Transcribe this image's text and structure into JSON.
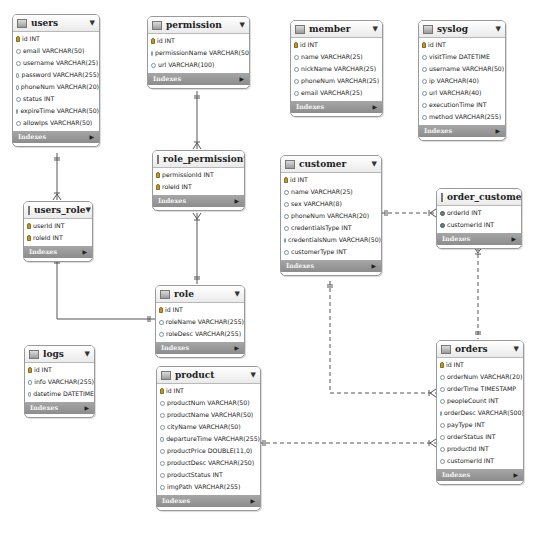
{
  "diagram": {
    "indexes_label": "Indexes",
    "tables": {
      "users": {
        "name": "users",
        "columns": [
          {
            "type": "key",
            "text": "id INT"
          },
          {
            "type": "attr",
            "text": "email VARCHAR(50)"
          },
          {
            "type": "attr",
            "text": "username VARCHAR(25)"
          },
          {
            "type": "attr",
            "text": "password VARCHAR(255)"
          },
          {
            "type": "attr",
            "text": "phoneNum VARCHAR(20)"
          },
          {
            "type": "attr",
            "text": "status INT"
          },
          {
            "type": "attr",
            "text": "expireTime VARCHAR(50)"
          },
          {
            "type": "attr",
            "text": "allowIps VARCHAR(50)"
          }
        ]
      },
      "permission": {
        "name": "permission",
        "columns": [
          {
            "type": "key",
            "text": "id INT"
          },
          {
            "type": "attr",
            "text": "permissionName VARCHAR(50)"
          },
          {
            "type": "attr",
            "text": "url VARCHAR(100)"
          }
        ]
      },
      "member": {
        "name": "member",
        "columns": [
          {
            "type": "key",
            "text": "id INT"
          },
          {
            "type": "attr",
            "text": "name VARCHAR(25)"
          },
          {
            "type": "attr",
            "text": "nickName VARCHAR(25)"
          },
          {
            "type": "attr",
            "text": "phoneNum VARCHAR(25)"
          },
          {
            "type": "attr",
            "text": "email VARCHAR(25)"
          }
        ]
      },
      "syslog": {
        "name": "syslog",
        "columns": [
          {
            "type": "key",
            "text": "id INT"
          },
          {
            "type": "attr",
            "text": "visitTime DATETIME"
          },
          {
            "type": "attr",
            "text": "username VARCHAR(50)"
          },
          {
            "type": "attr",
            "text": "ip VARCHAR(40)"
          },
          {
            "type": "attr",
            "text": "url VARCHAR(40)"
          },
          {
            "type": "attr",
            "text": "executionTime INT"
          },
          {
            "type": "attr",
            "text": "method VARCHAR(255)"
          }
        ]
      },
      "role_permission": {
        "name": "role_permission",
        "columns": [
          {
            "type": "key",
            "text": "permissionId INT"
          },
          {
            "type": "key",
            "text": "roleId INT"
          }
        ]
      },
      "customer": {
        "name": "customer",
        "columns": [
          {
            "type": "key",
            "text": "id INT"
          },
          {
            "type": "attr",
            "text": "name VARCHAR(25)"
          },
          {
            "type": "attr",
            "text": "sex VARCHAR(8)"
          },
          {
            "type": "attr",
            "text": "phoneNum VARCHAR(20)"
          },
          {
            "type": "attr",
            "text": "credentialsType INT"
          },
          {
            "type": "attr",
            "text": "credentialsNum VARCHAR(50)"
          },
          {
            "type": "attr",
            "text": "customerType INT"
          }
        ]
      },
      "order_customer": {
        "name": "order_customer",
        "columns": [
          {
            "type": "fk",
            "text": "orderId INT"
          },
          {
            "type": "fk",
            "text": "customerId INT"
          }
        ]
      },
      "users_role": {
        "name": "users_role",
        "columns": [
          {
            "type": "key",
            "text": "userId INT"
          },
          {
            "type": "key",
            "text": "roleId INT"
          }
        ]
      },
      "role": {
        "name": "role",
        "columns": [
          {
            "type": "key",
            "text": "id INT"
          },
          {
            "type": "attr",
            "text": "roleName VARCHAR(255)"
          },
          {
            "type": "attr",
            "text": "roleDesc VARCHAR(255)"
          }
        ]
      },
      "logs": {
        "name": "logs",
        "columns": [
          {
            "type": "key",
            "text": "id INT"
          },
          {
            "type": "attr",
            "text": "info VARCHAR(255)"
          },
          {
            "type": "attr",
            "text": "datetime DATETIME"
          }
        ]
      },
      "product": {
        "name": "product",
        "columns": [
          {
            "type": "key",
            "text": "id INT"
          },
          {
            "type": "attr",
            "text": "productNum VARCHAR(50)"
          },
          {
            "type": "attr",
            "text": "productName VARCHAR(50)"
          },
          {
            "type": "attr",
            "text": "cityName VARCHAR(50)"
          },
          {
            "type": "attr",
            "text": "departureTime VARCHAR(255)"
          },
          {
            "type": "attr",
            "text": "productPrice DOUBLE(11,0)"
          },
          {
            "type": "attr",
            "text": "productDesc VARCHAR(250)"
          },
          {
            "type": "attr",
            "text": "productStatus INT"
          },
          {
            "type": "attr",
            "text": "imgPath VARCHAR(255)"
          }
        ]
      },
      "orders": {
        "name": "orders",
        "columns": [
          {
            "type": "key",
            "text": "id INT"
          },
          {
            "type": "attr",
            "text": "orderNum VARCHAR(20)"
          },
          {
            "type": "attr",
            "text": "orderTime TIMESTAMP"
          },
          {
            "type": "attr",
            "text": "peopleCount INT"
          },
          {
            "type": "attr",
            "text": "orderDesc VARCHAR(500)"
          },
          {
            "type": "attr",
            "text": "payType INT"
          },
          {
            "type": "attr",
            "text": "orderStatus INT"
          },
          {
            "type": "attr",
            "text": "productId INT"
          },
          {
            "type": "attr",
            "text": "customerId INT"
          }
        ]
      }
    },
    "relationships": [
      {
        "from": "users",
        "to": "users_role",
        "style": "solid",
        "cardinality": "one-to-many"
      },
      {
        "from": "permission",
        "to": "role_permission",
        "style": "solid",
        "cardinality": "one-to-many"
      },
      {
        "from": "role",
        "to": "role_permission",
        "style": "solid",
        "cardinality": "one-to-many"
      },
      {
        "from": "role",
        "to": "users_role",
        "style": "solid",
        "cardinality": "one-to-many"
      },
      {
        "from": "customer",
        "to": "order_customer",
        "style": "dashed",
        "cardinality": "one-to-many"
      },
      {
        "from": "orders",
        "to": "order_customer",
        "style": "dashed",
        "cardinality": "one-to-many"
      },
      {
        "from": "customer",
        "to": "orders",
        "style": "dashed",
        "cardinality": "one-to-many"
      },
      {
        "from": "product",
        "to": "orders",
        "style": "dashed",
        "cardinality": "one-to-many"
      }
    ]
  }
}
